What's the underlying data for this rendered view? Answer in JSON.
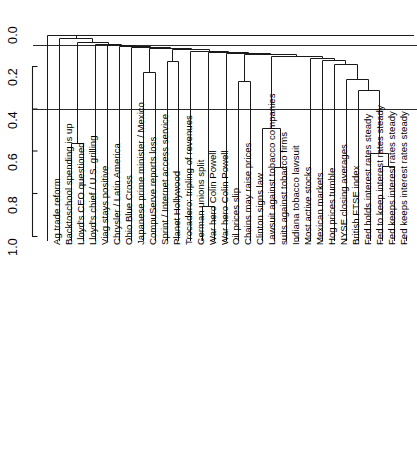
{
  "figure": {
    "type": "dendrogram",
    "background": "#ffffff",
    "line_color": "#1a1a1a",
    "rule_color": "#2b2b2b"
  },
  "chart_data": {
    "type": "dendrogram",
    "title": "",
    "xlabel": "",
    "ylabel": "",
    "ylim": [
      0.0,
      1.0
    ],
    "y_inverted": true,
    "grid": false,
    "axis_ticks": [
      "0.0",
      "0.2",
      "0.4",
      "0.6",
      "0.8",
      "1.0"
    ],
    "axis_tick_values": [
      0.0,
      0.2,
      0.4,
      0.6,
      0.8,
      1.0
    ],
    "axis_line_range": [
      0.2,
      1.0
    ],
    "reference_lines": [
      0.1,
      0.4
    ],
    "leaf_count": 32,
    "leaf_labels": [
      "Ag trade reform",
      "Backtoschool spending is up",
      "Lloyd's CEO questioned",
      "Lloyd's chief / U.S. grilling",
      "Viag stays positive",
      "Chrysler / Latin America",
      "Ohio Blue Cross",
      "Japanese prime minister / Mexico",
      "CompuServe reports loss",
      "Sprint / Internet access service",
      "Planet Hollywood",
      "Trocadero: tripling of revenues",
      "German unions split",
      "War hero Colin Powell",
      "War hero Colin Powell",
      "Oil prices slip",
      "Chains may raise prices",
      "Clinton signs law",
      "Lawsuit against tobacco companies",
      "suits against tobacco firms",
      "Indiana tobacco lawsuit",
      "Most active stocks",
      "Mexican markets",
      "Hog prices tumble",
      "NYSE closing averages",
      "British FTSE index",
      "Fed holds interest rates steady",
      "Fed to keep interest rates steady",
      "Fed keeps interest rates steady",
      "Fed keeps interest rates steady"
    ],
    "merge_heights": [
      0.05,
      0.06,
      0.07,
      0.075,
      0.08,
      0.085,
      0.09,
      0.095,
      0.1,
      0.105,
      0.11,
      0.115,
      0.12,
      0.125,
      0.13,
      0.135,
      0.14,
      0.15,
      0.16,
      0.17,
      0.175,
      0.19,
      0.225,
      0.26,
      0.27,
      0.31,
      0.49,
      0.56,
      0.61,
      0.67,
      0.675,
      0.86
    ],
    "notable_deep_merges": [
      {
        "label": "Lloyd's CEO pair",
        "height": 0.56
      },
      {
        "label": "German unions split branch",
        "height": 0.86
      },
      {
        "label": "tobacco cluster",
        "height": 0.49
      },
      {
        "label": "tobacco subcluster",
        "height": 0.675
      },
      {
        "label": "Fed rates subcluster",
        "height": 0.67
      },
      {
        "label": "Fed rates cluster",
        "height": 0.61
      }
    ]
  }
}
